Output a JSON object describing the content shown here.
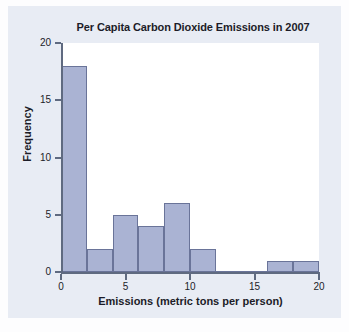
{
  "chart_data": {
    "type": "bar",
    "title": "Per Capita Carbon Dioxide Emissions in 2007",
    "xlabel": "Emissions (metric tons per person)",
    "ylabel": "Frequency",
    "categories": [
      "0-2",
      "2-4",
      "4-6",
      "6-8",
      "8-10",
      "10-12",
      "12-14",
      "14-16",
      "16-18",
      "18-20"
    ],
    "bin_edges": [
      0,
      2,
      4,
      6,
      8,
      10,
      12,
      14,
      16,
      18,
      20
    ],
    "bin_width": 2,
    "values": [
      18,
      2,
      5,
      4,
      6,
      2,
      0,
      0,
      1,
      1
    ],
    "xlim": [
      0,
      20
    ],
    "ylim": [
      0,
      20
    ],
    "xticks": [
      0,
      5,
      10,
      15,
      20
    ],
    "yticks": [
      0,
      5,
      10,
      15,
      20
    ],
    "xtick_labels": [
      "0",
      "5",
      "10",
      "15",
      "20"
    ],
    "ytick_labels": [
      "0",
      "5",
      "10",
      "15",
      "20"
    ],
    "grid": false,
    "legend": false,
    "bar_fill_color": "#aab3d3",
    "bar_edge_color": "#6a7499",
    "axis_color": "#5f6a80",
    "plot_bg_color": "#ffffff",
    "panel_bg_color": "#e8ecf4"
  }
}
